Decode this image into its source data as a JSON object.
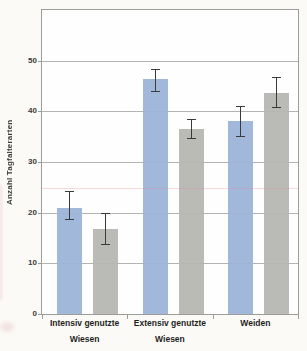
{
  "chart_data": {
    "type": "bar",
    "title": "",
    "xlabel": "",
    "ylabel": "Anzahl Tagfalterarten",
    "ylim": [
      0,
      60
    ],
    "yticks": [
      0,
      10,
      20,
      30,
      40,
      50
    ],
    "grid": "horizontal",
    "legend_position": "none",
    "categories": [
      {
        "lines": [
          "Intensiv genutzte",
          "Wiesen"
        ]
      },
      {
        "lines": [
          "Extensiv genutzte",
          "Wiesen"
        ]
      },
      {
        "lines": [
          "Weiden"
        ]
      }
    ],
    "series": [
      {
        "name": "blue",
        "color": "#9cb4d8",
        "values": [
          21.0,
          46.3,
          38.1
        ],
        "errors_low": [
          18.7,
          44.0,
          35.2
        ],
        "errors_high": [
          24.3,
          48.4,
          41.0
        ]
      },
      {
        "name": "gray",
        "color": "#b6b6b2",
        "values": [
          16.7,
          36.6,
          43.7
        ],
        "errors_low": [
          13.9,
          34.8,
          40.8
        ],
        "errors_high": [
          19.9,
          38.5,
          46.7
        ]
      }
    ]
  },
  "colors": {
    "page_background": "#fbfaf7",
    "plot_background": "#fefefe",
    "frame": "#9c9c98",
    "gridline": "#b3b3af",
    "error_bar": "#3a3a38",
    "tick_text": "#3b3b39",
    "category_text": "#1f1f1d"
  }
}
